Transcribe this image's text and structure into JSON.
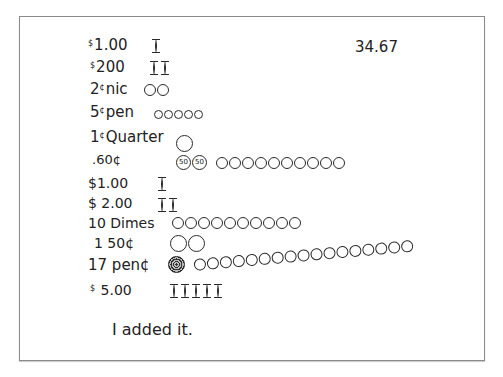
{
  "document": {
    "total": "34.67",
    "rows": [
      {
        "label_sup": "$",
        "label": "1.00",
        "marks": {
          "bills": 1
        }
      },
      {
        "label_sup": "$",
        "label": "200",
        "marks": {
          "bills": 2
        }
      },
      {
        "label": "2",
        "label_sup_after": "¢",
        "label_tail": "nic",
        "marks": {
          "coins": 2,
          "size": "mid"
        }
      },
      {
        "label": "5",
        "label_sup_after": "¢",
        "label_tail": "pen",
        "marks": {
          "coins": 5,
          "size": "small"
        }
      },
      {
        "label": "1",
        "label_sup_after": "¢",
        "label_tail": "Quarter",
        "marks": {
          "coins": 1,
          "size": "big"
        }
      },
      {
        "label": ".60¢",
        "marks": {
          "half_dollars": 2,
          "half_text": "50",
          "coins": 10,
          "size": "mid"
        }
      },
      {
        "label": "$1.00",
        "marks": {
          "bills": 1
        }
      },
      {
        "label": "$ 2.00",
        "marks": {
          "bills": 2
        }
      },
      {
        "label": "10 Dimes",
        "marks": {
          "coins": 10,
          "size": "mid"
        }
      },
      {
        "label": "1 50¢",
        "marks": {
          "coins": 2,
          "size": "big"
        }
      },
      {
        "label": "17 pen¢",
        "marks": {
          "scribbled": 1,
          "coins": 17,
          "size": "mid"
        }
      },
      {
        "label_sup": "$",
        "label": " 5.00",
        "marks": {
          "bills": 5
        }
      }
    ],
    "note": "I added it."
  }
}
